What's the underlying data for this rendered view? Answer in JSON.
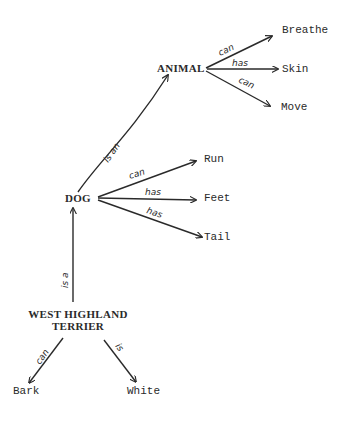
{
  "diagram": {
    "type": "semantic-network",
    "nodes": {
      "animal": "ANIMAL",
      "breathe": "Breathe",
      "skin": "Skin",
      "move": "Move",
      "dog": "DOG",
      "run": "Run",
      "feet": "Feet",
      "tail": "Tail",
      "westie_line1": "WEST HIGHLAND",
      "westie_line2": "TERRIER",
      "bark": "Bark",
      "white": "White"
    },
    "edges": [
      {
        "from": "ANIMAL",
        "to": "Breathe",
        "label": "can"
      },
      {
        "from": "ANIMAL",
        "to": "Skin",
        "label": "has"
      },
      {
        "from": "ANIMAL",
        "to": "Move",
        "label": "can"
      },
      {
        "from": "DOG",
        "to": "ANIMAL",
        "label": "is an"
      },
      {
        "from": "DOG",
        "to": "Run",
        "label": "can"
      },
      {
        "from": "DOG",
        "to": "Feet",
        "label": "has"
      },
      {
        "from": "DOG",
        "to": "Tail",
        "label": "has"
      },
      {
        "from": "WEST HIGHLAND TERRIER",
        "to": "DOG",
        "label": "is a"
      },
      {
        "from": "WEST HIGHLAND TERRIER",
        "to": "Bark",
        "label": "can"
      },
      {
        "from": "WEST HIGHLAND TERRIER",
        "to": "White",
        "label": "is"
      }
    ],
    "labels": {
      "animal_breathe": "can",
      "animal_skin": "has",
      "animal_move": "can",
      "dog_animal": "is an",
      "dog_run": "can",
      "dog_feet": "has",
      "dog_tail": "has",
      "westie_dog": "is a",
      "westie_bark": "can",
      "westie_white": "is"
    },
    "colors": {
      "ink": "#2a2a2a",
      "background": "#ffffff"
    }
  }
}
